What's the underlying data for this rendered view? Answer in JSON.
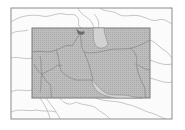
{
  "map": {
    "type": "locator-map",
    "region": "Middle East",
    "highlight_label": "Area of interest",
    "colors": {
      "background": "#ffffff",
      "frame": "#8c8c8c",
      "land": "#fafafa",
      "borders": "#b4b4b4",
      "highlight_fill": "#bdbdbd",
      "highlight_stroke": "#7a7a7a",
      "highlight_borders": "#8a8a8a",
      "water_in_box": "#d6d6d6"
    }
  }
}
